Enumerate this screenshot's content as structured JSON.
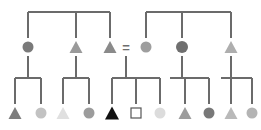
{
  "figure": {
    "kind": "pedigree-chart",
    "width": 261,
    "height": 130,
    "background": "#ffffff",
    "line_color": "#6b6b6b",
    "line_width": 1.2,
    "mating_symbol": "=",
    "mating_symbol_color": "#6e6e6e",
    "generation_rows": [
      {
        "id": "gen-1",
        "y": 47
      },
      {
        "id": "gen-2",
        "y": 113
      }
    ]
  },
  "legend_colors": {
    "black": "#111111",
    "dark_gray": "#777777",
    "mid_gray": "#8f8f8f",
    "light_gray": "#bdbdbd",
    "pale_gray": "#d8d8d8",
    "very_pale": "#e4e4e4",
    "open_outline": "#555555"
  },
  "chart_data": {
    "type": "diagram",
    "title": "",
    "nodes": [
      {
        "id": "g1-1",
        "generation": 1,
        "shape": "circle",
        "x": 28,
        "y": 47,
        "size": 11,
        "fill": "#7a7a7a",
        "label": "",
        "affected": "partial"
      },
      {
        "id": "g1-2",
        "generation": 1,
        "shape": "triangle",
        "x": 76,
        "y": 47,
        "size": 13,
        "fill": "#9a9a9a",
        "label": "",
        "affected": "partial"
      },
      {
        "id": "g1-3",
        "generation": 1,
        "shape": "triangle",
        "x": 110,
        "y": 47,
        "size": 13,
        "fill": "#8a8a8a",
        "label": "",
        "affected": "partial"
      },
      {
        "id": "g1-4",
        "generation": 1,
        "shape": "circle",
        "x": 146,
        "y": 47,
        "size": 11,
        "fill": "#9e9e9e",
        "label": "",
        "affected": "partial"
      },
      {
        "id": "g1-5",
        "generation": 1,
        "shape": "circle",
        "x": 182,
        "y": 47,
        "size": 12,
        "fill": "#6f6f6f",
        "label": "",
        "affected": "partial"
      },
      {
        "id": "g1-6",
        "generation": 1,
        "shape": "triangle",
        "x": 231,
        "y": 47,
        "size": 13,
        "fill": "#aeaeae",
        "label": "",
        "affected": "partial"
      },
      {
        "id": "g2-1",
        "generation": 2,
        "shape": "triangle",
        "x": 15,
        "y": 113,
        "size": 13,
        "fill": "#7e7e7e",
        "label": "",
        "affected": "partial"
      },
      {
        "id": "g2-2",
        "generation": 2,
        "shape": "circle",
        "x": 41,
        "y": 113,
        "size": 11,
        "fill": "#c2c2c2",
        "label": "",
        "affected": "partial"
      },
      {
        "id": "g2-3",
        "generation": 2,
        "shape": "triangle",
        "x": 63,
        "y": 113,
        "size": 13,
        "fill": "#e0e0e0",
        "label": "",
        "affected": "none"
      },
      {
        "id": "g2-4",
        "generation": 2,
        "shape": "circle",
        "x": 89,
        "y": 113,
        "size": 11,
        "fill": "#9c9c9c",
        "label": "",
        "affected": "partial"
      },
      {
        "id": "g2-5",
        "generation": 2,
        "shape": "triangle",
        "x": 112,
        "y": 113,
        "size": 14,
        "fill": "#111111",
        "label": "",
        "affected": "full"
      },
      {
        "id": "g2-6",
        "generation": 2,
        "shape": "square",
        "x": 136,
        "y": 113,
        "size": 10,
        "fill": "#ffffff",
        "stroke": "#555555",
        "label": "",
        "affected": "none"
      },
      {
        "id": "g2-7",
        "generation": 2,
        "shape": "circle",
        "x": 160,
        "y": 113,
        "size": 11,
        "fill": "#dcdcdc",
        "label": "",
        "affected": "none"
      },
      {
        "id": "g2-8",
        "generation": 2,
        "shape": "triangle",
        "x": 185,
        "y": 113,
        "size": 13,
        "fill": "#9d9d9d",
        "label": "",
        "affected": "partial"
      },
      {
        "id": "g2-9",
        "generation": 2,
        "shape": "circle",
        "x": 209,
        "y": 113,
        "size": 11,
        "fill": "#787878",
        "label": "",
        "affected": "partial"
      },
      {
        "id": "g2-10",
        "generation": 2,
        "shape": "triangle",
        "x": 231,
        "y": 113,
        "size": 13,
        "fill": "#b9b9b9",
        "label": "",
        "affected": "partial"
      },
      {
        "id": "g2-11",
        "generation": 2,
        "shape": "circle",
        "x": 252,
        "y": 113,
        "size": 11,
        "fill": "#b4b4b4",
        "label": "",
        "affected": "partial"
      }
    ],
    "edges": [
      {
        "id": "sib-bar-top-left",
        "type": "sibship-bar",
        "y": 12,
        "x1": 28,
        "x2": 110
      },
      {
        "id": "sib-bar-top-right",
        "type": "sibship-bar",
        "y": 12,
        "x1": 146,
        "x2": 231
      },
      {
        "id": "drop-g1-1",
        "type": "drop",
        "x": 28,
        "y1": 12,
        "y2": 38
      },
      {
        "id": "drop-g1-2",
        "type": "drop",
        "x": 76,
        "y1": 12,
        "y2": 38
      },
      {
        "id": "drop-g1-3",
        "type": "drop",
        "x": 110,
        "y1": 12,
        "y2": 38
      },
      {
        "id": "drop-g1-4",
        "type": "drop",
        "x": 146,
        "y1": 12,
        "y2": 38
      },
      {
        "id": "drop-g1-5",
        "type": "drop",
        "x": 182,
        "y1": 12,
        "y2": 38
      },
      {
        "id": "drop-g1-6",
        "type": "drop",
        "x": 231,
        "y1": 12,
        "y2": 38
      },
      {
        "id": "desc-g1-1",
        "type": "descent",
        "x": 28,
        "y1": 56,
        "y2": 77
      },
      {
        "id": "desc-g1-2",
        "type": "descent",
        "x": 76,
        "y1": 56,
        "y2": 77
      },
      {
        "id": "desc-mate",
        "type": "descent",
        "x": 126,
        "y1": 56,
        "y2": 77
      },
      {
        "id": "desc-g1-5",
        "type": "descent",
        "x": 182,
        "y1": 56,
        "y2": 77
      },
      {
        "id": "desc-g1-6",
        "type": "descent",
        "x": 231,
        "y1": 56,
        "y2": 77
      },
      {
        "id": "sib-bar-1",
        "type": "sibship-bar",
        "y": 78,
        "x1": 15,
        "x2": 41
      },
      {
        "id": "sib-bar-2",
        "type": "sibship-bar",
        "y": 78,
        "x1": 63,
        "x2": 89
      },
      {
        "id": "sib-bar-3",
        "type": "sibship-bar",
        "y": 78,
        "x1": 112,
        "x2": 160
      },
      {
        "id": "sib-bar-4",
        "type": "sibship-bar",
        "y": 78,
        "x1": 170,
        "x2": 209
      },
      {
        "id": "sib-bar-5",
        "type": "sibship-bar",
        "y": 78,
        "x1": 221,
        "x2": 252
      },
      {
        "id": "drop-g2-1",
        "type": "drop",
        "x": 15,
        "y1": 78,
        "y2": 104
      },
      {
        "id": "drop-g2-2",
        "type": "drop",
        "x": 41,
        "y1": 78,
        "y2": 104
      },
      {
        "id": "drop-g2-3",
        "type": "drop",
        "x": 63,
        "y1": 78,
        "y2": 104
      },
      {
        "id": "drop-g2-4",
        "type": "drop",
        "x": 89,
        "y1": 78,
        "y2": 104
      },
      {
        "id": "drop-g2-5",
        "type": "drop",
        "x": 112,
        "y1": 78,
        "y2": 104
      },
      {
        "id": "drop-g2-6",
        "type": "drop",
        "x": 136,
        "y1": 78,
        "y2": 104
      },
      {
        "id": "drop-g2-7",
        "type": "drop",
        "x": 160,
        "y1": 78,
        "y2": 104
      },
      {
        "id": "drop-g2-8",
        "type": "drop",
        "x": 185,
        "y1": 78,
        "y2": 104
      },
      {
        "id": "drop-g2-9",
        "type": "drop",
        "x": 209,
        "y1": 78,
        "y2": 104
      },
      {
        "id": "drop-g2-10",
        "type": "drop",
        "x": 231,
        "y1": 78,
        "y2": 104
      },
      {
        "id": "drop-g2-11",
        "type": "drop",
        "x": 252,
        "y1": 78,
        "y2": 104
      }
    ],
    "annotations": [
      {
        "id": "mating-equals",
        "text": "=",
        "x": 126,
        "y": 47
      }
    ]
  }
}
